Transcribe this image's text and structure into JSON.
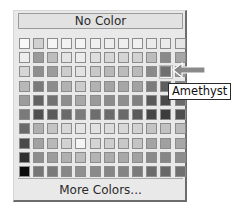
{
  "color_picker": {
    "no_color_label": "No Color",
    "more_colors_label": "More Colors...",
    "columns": 12,
    "rows": 10,
    "selected": {
      "row": 2,
      "col": 10,
      "name": "Amethyst"
    },
    "swatches": [
      [
        "#f8f8f8",
        "#d0d0d0",
        "#f4f4f4",
        "#f2f2f2",
        "#f4f4f4",
        "#f0f0f0",
        "#ededed",
        "#efefef",
        "#f0f0f0",
        "#ebebeb",
        "#ececec",
        "#e6e6e6"
      ],
      [
        "#eeeeee",
        "#9a9a9a",
        "#bdbdbd",
        "#e4e4e4",
        "#ececec",
        "#dedede",
        "#d6d6d6",
        "#d4d4d4",
        "#d2d2d2",
        "#bcbcbc",
        "#8a8a8a",
        "#a6a6a6"
      ],
      [
        "#d6d6d6",
        "#8e8e8e",
        "#9c9c9c",
        "#cdcdcd",
        "#e2e2e2",
        "#c8c8c8",
        "#b8b8b8",
        "#bcbcbc",
        "#bababa",
        "#8a8a8a",
        "#707070",
        "#9a9a9a"
      ],
      [
        "#b8b8b8",
        "#7a7a7a",
        "#8c8c8c",
        "#b2b2b2",
        "#cccccc",
        "#b2b2b2",
        "#a4a4a4",
        "#a6a6a6",
        "#a2a2a2",
        "#7c7c7c",
        "#5e5e5e",
        "#8a8a8a"
      ],
      [
        "#9c9c9c",
        "#626262",
        "#727272",
        "#8e8e8e",
        "#a8a8a8",
        "#9a9a9a",
        "#8c8c8c",
        "#8e8e8e",
        "#808080",
        "#5a5a5a",
        "#4a4a4a",
        "#6a6a6a"
      ],
      [
        "#7a7a7a",
        "#505050",
        "#5a5a5a",
        "#6a6a6a",
        "#7c7c7c",
        "#6e6e6e",
        "#6c6c6c",
        "#6a6a6a",
        "#5a5a5a",
        "#464646",
        "#3c3c3c",
        "#4e4e4e"
      ],
      [
        "#6a6a6a",
        "#b0b0b0",
        "#c4c4c4",
        "#d8d8d8",
        "#e4e4e4",
        "#e2e2e2",
        "#dcdcdc",
        "#d8d8d8",
        "#d2d2d2",
        "#c4c4c4",
        "#c2c2c2",
        "#bcbcbc"
      ],
      [
        "#4a4a4a",
        "#a2a2a2",
        "#b8b8b8",
        "#d2d2d2",
        "#f4f4f4",
        "#d4d4d4",
        "#cecece",
        "#c8c8c8",
        "#c4c4c4",
        "#a4a4a4",
        "#a0a0a0",
        "#a8a8a8"
      ],
      [
        "#303030",
        "#8e8e8e",
        "#9c9c9c",
        "#b0b0b0",
        "#bcbcbc",
        "#b4b4b4",
        "#acacac",
        "#a8a8a8",
        "#a2a2a2",
        "#8a8a8a",
        "#868686",
        "#8e8e8e"
      ],
      [
        "#0c0c0c",
        "#767676",
        "#7a7a7a",
        "#888888",
        "#909090",
        "#8a8a8a",
        "#868686",
        "#848484",
        "#7a7a7a",
        "#6c6c6c",
        "#686868",
        "#707070"
      ]
    ]
  },
  "annotation": {
    "arrow_color": "#8a8a8a",
    "arrow_direction": "left"
  },
  "tooltip": {
    "text": "Amethyst"
  }
}
